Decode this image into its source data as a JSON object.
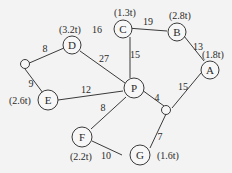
{
  "diagram": {
    "type": "weighted-graph",
    "nodes": [
      {
        "id": "D",
        "label": "D",
        "capacity": "(3.2t)"
      },
      {
        "id": "C",
        "label": "C",
        "capacity": "(1.3t)"
      },
      {
        "id": "B",
        "label": "B",
        "capacity": "(2.8t)"
      },
      {
        "id": "A",
        "label": "A",
        "capacity": "(1.8t)"
      },
      {
        "id": "P",
        "label": "P",
        "capacity": ""
      },
      {
        "id": "E",
        "label": "E",
        "capacity": "(2.6t)"
      },
      {
        "id": "F",
        "label": "F",
        "capacity": "(2.2t)"
      },
      {
        "id": "G",
        "label": "G",
        "capacity": "(1.6t)"
      },
      {
        "id": "J1",
        "label": "",
        "capacity": ""
      },
      {
        "id": "J2",
        "label": "",
        "capacity": ""
      }
    ],
    "edges": [
      {
        "from": "J1",
        "to": "D",
        "weight": "8"
      },
      {
        "from": "J1",
        "to": "E",
        "weight": "9"
      },
      {
        "from": "D",
        "to": "P",
        "weight": "27"
      },
      {
        "from": "D",
        "to": "C",
        "weight": "16"
      },
      {
        "from": "C",
        "to": "B",
        "weight": "19"
      },
      {
        "from": "C",
        "to": "P",
        "weight": "15"
      },
      {
        "from": "B",
        "to": "A",
        "weight": "13"
      },
      {
        "from": "A",
        "to": "J2",
        "weight": "15"
      },
      {
        "from": "P",
        "to": "J2",
        "weight": "4"
      },
      {
        "from": "E",
        "to": "P",
        "weight": "12"
      },
      {
        "from": "P",
        "to": "F",
        "weight": "8"
      },
      {
        "from": "F",
        "to": "G",
        "weight": "10"
      },
      {
        "from": "J2",
        "to": "G",
        "weight": "7"
      }
    ]
  }
}
